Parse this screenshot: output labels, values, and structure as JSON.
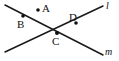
{
  "figure": {
    "type": "geometry-diagram",
    "width": 119,
    "height": 61,
    "background_color": "#ffffff",
    "ink_color": "#111111",
    "stroke_width": 1.5,
    "points": [
      {
        "id": "A",
        "label": "A",
        "has_dot": true,
        "dot": {
          "cx": 38,
          "cy": 10,
          "r": 1.8
        },
        "label_pos": {
          "x": 42,
          "y": 3
        },
        "on_line": null,
        "note": "isolated point not on either line"
      },
      {
        "id": "B",
        "label": "B",
        "has_dot": true,
        "dot": {
          "cx": 23,
          "cy": 16,
          "r": 1.8
        },
        "label_pos": {
          "x": 17,
          "y": 19
        },
        "on_line": "m",
        "note": "point on line m, upper left branch"
      },
      {
        "id": "C",
        "label": "C",
        "has_dot": true,
        "dot": {
          "cx": 57,
          "cy": 33,
          "r": 2.0
        },
        "label_pos": {
          "x": 52,
          "y": 36
        },
        "on_line": "l,m",
        "note": "intersection of lines l and m"
      },
      {
        "id": "D",
        "label": "D",
        "has_dot": true,
        "dot": {
          "cx": 76,
          "cy": 23,
          "r": 1.8
        },
        "label_pos": {
          "x": 69,
          "y": 12
        },
        "on_line": "l",
        "note": "point on line l, upper right branch"
      }
    ],
    "lines": [
      {
        "id": "l",
        "label": "l",
        "label_style": "italic",
        "from": {
          "x": 5,
          "y": 52
        },
        "to": {
          "x": 103,
          "y": 6
        },
        "label_pos": {
          "x": 106,
          "y": 1
        },
        "note": "rises left-to-right through C and D"
      },
      {
        "id": "m",
        "label": "m",
        "label_style": "italic",
        "from": {
          "x": 5,
          "y": 5
        },
        "to": {
          "x": 103,
          "y": 55
        },
        "label_pos": {
          "x": 105,
          "y": 47
        },
        "note": "falls left-to-right through B and C"
      }
    ]
  }
}
